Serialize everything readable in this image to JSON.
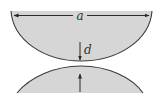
{
  "diagram": {
    "labels": {
      "width": "a",
      "gap": "d"
    },
    "colors": {
      "fill": "#d6d6d6",
      "stroke": "#3a3a3a",
      "background": "#ffffff"
    },
    "shapes": [
      "upper-lens-bowl",
      "lower-lens-dome"
    ],
    "arrows": [
      "width-dimension-arrow",
      "gap-arrow-down",
      "gap-arrow-up"
    ]
  }
}
